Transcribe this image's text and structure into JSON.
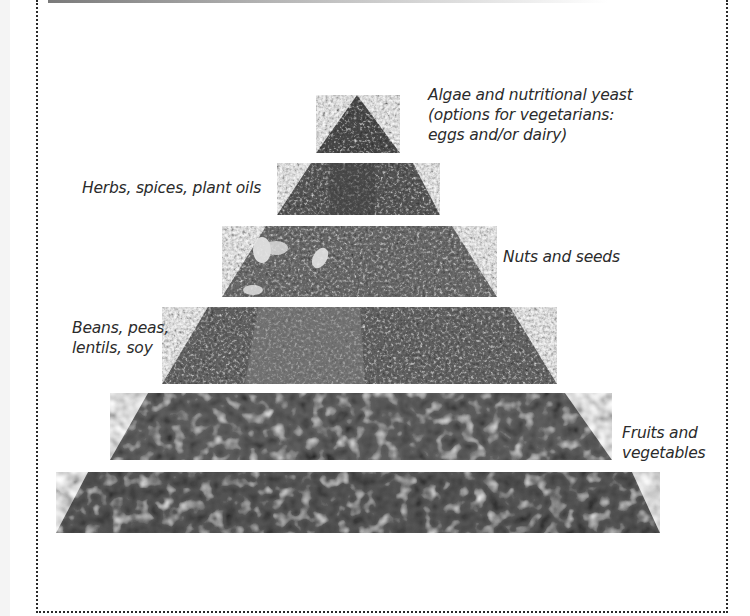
{
  "diagram": {
    "type": "food-pyramid",
    "style": "grayscale photographic tiers",
    "tiers": [
      {
        "level": 1,
        "position": "top",
        "label_lines": [
          "Algae and nutritional yeast",
          "(options for vegetarians:",
          "eggs and/or dairy)"
        ],
        "label_side": "right",
        "fill": "#4a4a4a"
      },
      {
        "level": 2,
        "label_lines": [
          "Herbs, spices, plant oils"
        ],
        "label_side": "left",
        "fill": "#575757"
      },
      {
        "level": 3,
        "label_lines": [
          "Nuts and seeds"
        ],
        "label_side": "right",
        "fill": "#6a6a6a"
      },
      {
        "level": 4,
        "label_lines": [
          "Beans, peas,",
          "lentils, soy"
        ],
        "label_side": "left",
        "fill": "#636363"
      },
      {
        "level": 5,
        "label_lines": [
          "Fruits and",
          "vegetables"
        ],
        "label_side": "right",
        "fill": "#5e5e5e"
      },
      {
        "level": 6,
        "position": "base",
        "label_lines": [],
        "label_side": "none",
        "fill": "#555555"
      }
    ]
  },
  "colors": {
    "background": "#ffffff",
    "border": "#2a2a2a",
    "text": "#2b2b2b"
  }
}
